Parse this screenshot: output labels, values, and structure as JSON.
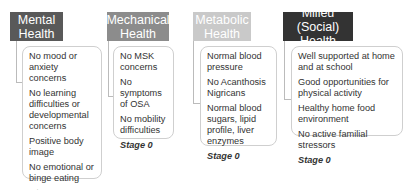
{
  "columns": [
    {
      "title": "Mental Health",
      "title_lines": [
        "Mental",
        "Health"
      ],
      "header_color": "#595959",
      "items": [
        "No mood or anxiety concerns",
        "No learning difficulties or developmental concerns",
        "Positive body image",
        "No emotional or binge eating"
      ],
      "stage": "Stage 0"
    },
    {
      "title": "Mechanical Health",
      "title_lines": [
        "Mechanical",
        "Health"
      ],
      "header_color": "#8c8c8c",
      "items": [
        "No MSK concerns",
        "No symptoms of OSA",
        "No mobility difficulties"
      ],
      "stage": "Stage 0"
    },
    {
      "title": "Metabolic Health",
      "title_lines": [
        "Metabolic",
        "Health"
      ],
      "header_color": "#c9c9c9",
      "items": [
        "Normal blood pressure",
        "No Acanthosis Nigricans",
        "Normal blood sugars, lipid profile, liver enzymes"
      ],
      "stage": "Stage 0"
    },
    {
      "title": "Milieu (Social) Health",
      "title_lines": [
        "Milieu (Social)",
        "Health"
      ],
      "header_color": "#333333",
      "items": [
        "Well supported at home and at school",
        "Good opportunities for physical activity",
        "Healthy home food environment",
        "No active familial stressors"
      ],
      "stage": "Stage 0"
    }
  ]
}
